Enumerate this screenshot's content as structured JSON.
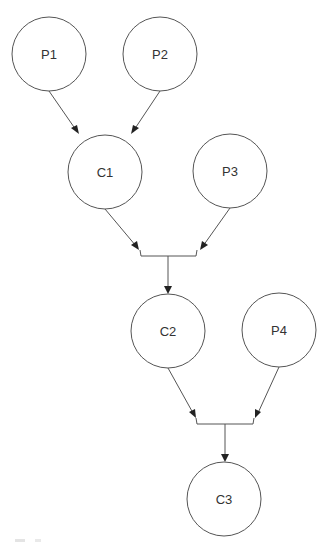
{
  "diagram": {
    "type": "flow",
    "colors": {
      "stroke": "#555555",
      "arrow": "#222222",
      "label": "#333333",
      "background": "#ffffff"
    },
    "nodes": [
      {
        "id": "P1",
        "label": "P1",
        "cx": 49,
        "cy": 54,
        "r": 37
      },
      {
        "id": "P2",
        "label": "P2",
        "cx": 160,
        "cy": 54,
        "r": 37
      },
      {
        "id": "C1",
        "label": "C1",
        "cx": 105,
        "cy": 172,
        "r": 37
      },
      {
        "id": "P3",
        "label": "P3",
        "cx": 230,
        "cy": 171,
        "r": 37
      },
      {
        "id": "C2",
        "label": "C2",
        "cx": 168,
        "cy": 331,
        "r": 37
      },
      {
        "id": "P4",
        "label": "P4",
        "cx": 279,
        "cy": 330,
        "r": 37
      },
      {
        "id": "C3",
        "label": "C3",
        "cx": 224,
        "cy": 499,
        "r": 37
      }
    ],
    "edges": [
      {
        "from": "P1",
        "to": "C1"
      },
      {
        "from": "P2",
        "to": "C1"
      },
      {
        "from": "C1",
        "to": "C2",
        "via": "junction-1"
      },
      {
        "from": "P3",
        "to": "C2",
        "via": "junction-1"
      },
      {
        "from": "C2",
        "to": "C3",
        "via": "junction-2"
      },
      {
        "from": "P4",
        "to": "C3",
        "via": "junction-2"
      }
    ]
  }
}
